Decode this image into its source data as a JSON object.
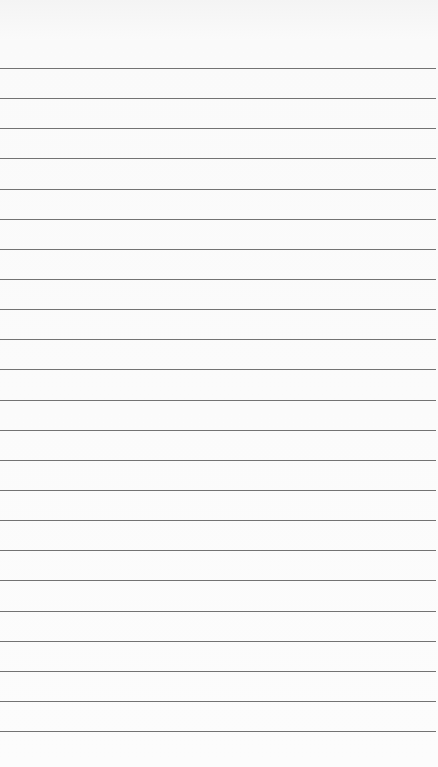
{
  "paper": {
    "type": "lined-paper",
    "background_color": "#fbfbfb",
    "line_color": "#5a5a5a",
    "line_count": 23,
    "first_line_y": 68,
    "line_spacing": 30.14
  }
}
